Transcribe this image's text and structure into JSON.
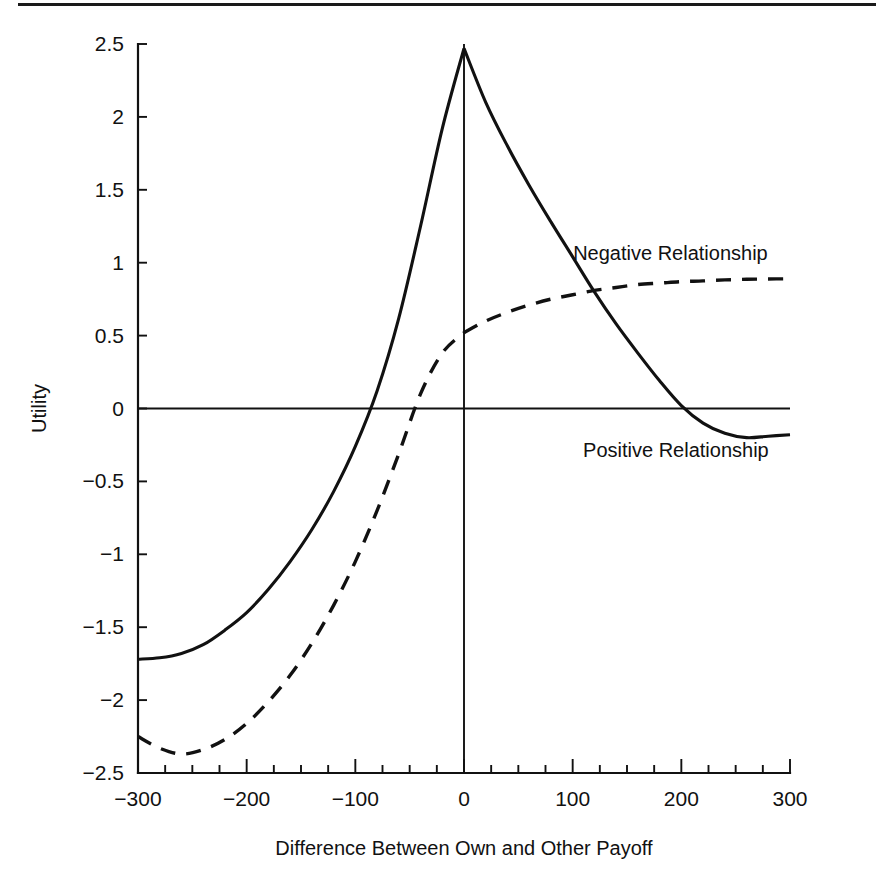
{
  "chart_data": {
    "type": "line",
    "title": "",
    "xlabel": "Difference Between Own and Other Payoff",
    "ylabel": "Utility",
    "xlim": [
      -300,
      300
    ],
    "ylim": [
      -2.5,
      2.5
    ],
    "grid": false,
    "legend_position": "inline-annotation",
    "xticks": [
      -300,
      -200,
      -100,
      0,
      100,
      200,
      300
    ],
    "xtick_labels": [
      "−300",
      "−200",
      "−100",
      "0",
      "100",
      "200",
      "300"
    ],
    "xminor_tick_step": 25,
    "yticks": [
      -2.5,
      -2,
      -1.5,
      -1,
      -0.5,
      0,
      0.5,
      1,
      1.5,
      2,
      2.5
    ],
    "ytick_labels": [
      "−2.5",
      "−2",
      "−1.5",
      "−1",
      "−0.5",
      "0",
      "0.5",
      "1",
      "1.5",
      "2",
      "2.5"
    ],
    "annotations": [
      {
        "text": "Negative Relationship",
        "x": 190,
        "y": 1.02
      },
      {
        "text": "Positive Relationship",
        "x": 195,
        "y": -0.33
      }
    ],
    "series": [
      {
        "name": "Positive Relationship",
        "style": "solid",
        "color": "#111111",
        "x": [
          -300,
          -280,
          -260,
          -240,
          -220,
          -200,
          -180,
          -160,
          -140,
          -120,
          -100,
          -80,
          -60,
          -40,
          -20,
          0,
          20,
          40,
          60,
          80,
          100,
          120,
          140,
          160,
          180,
          200,
          220,
          240,
          260,
          280,
          300
        ],
        "y": [
          -1.72,
          -1.71,
          -1.68,
          -1.62,
          -1.52,
          -1.4,
          -1.24,
          -1.05,
          -0.83,
          -0.57,
          -0.26,
          0.12,
          0.62,
          1.25,
          1.92,
          2.47,
          2.1,
          1.8,
          1.53,
          1.28,
          1.04,
          0.8,
          0.58,
          0.38,
          0.19,
          0.02,
          -0.1,
          -0.17,
          -0.2,
          -0.19,
          -0.18
        ]
      },
      {
        "name": "Negative Relationship",
        "style": "dashed",
        "color": "#111111",
        "x": [
          -300,
          -280,
          -260,
          -240,
          -220,
          -200,
          -180,
          -160,
          -140,
          -120,
          -100,
          -80,
          -60,
          -40,
          -20,
          0,
          20,
          40,
          60,
          80,
          100,
          120,
          140,
          160,
          180,
          200,
          220,
          240,
          260,
          280,
          300
        ],
        "y": [
          -2.25,
          -2.33,
          -2.37,
          -2.34,
          -2.27,
          -2.16,
          -2.01,
          -1.83,
          -1.61,
          -1.35,
          -1.05,
          -0.7,
          -0.31,
          0.1,
          0.38,
          0.52,
          0.6,
          0.66,
          0.71,
          0.75,
          0.78,
          0.81,
          0.83,
          0.85,
          0.86,
          0.87,
          0.875,
          0.882,
          0.886,
          0.888,
          0.89
        ]
      }
    ]
  },
  "figure": {
    "top_rule": "horizontal-rule"
  }
}
